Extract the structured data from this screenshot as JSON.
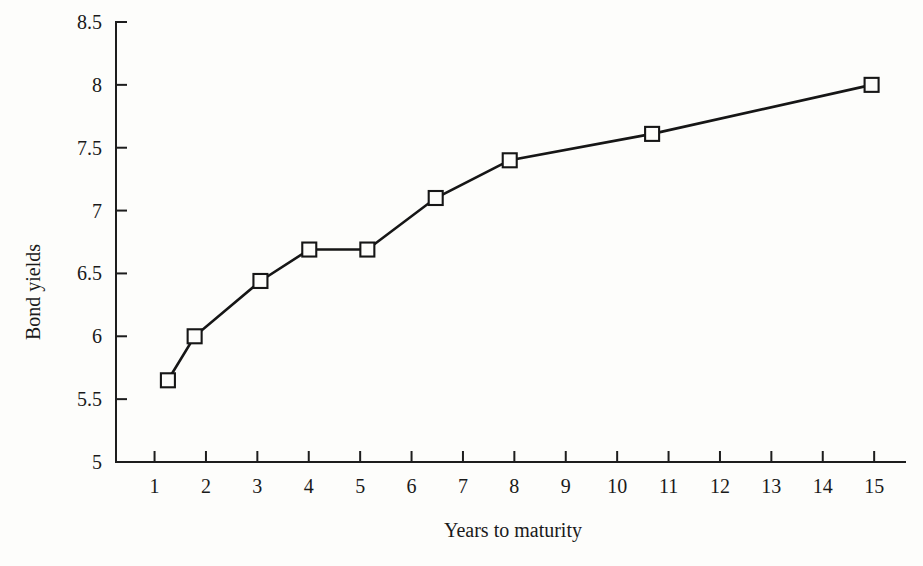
{
  "chart_data": {
    "type": "line",
    "title": "",
    "subtitle": "",
    "xlabel": "Years to maturity",
    "ylabel": "Bond yields",
    "xlim": [
      0.25,
      15.6
    ],
    "ylim": [
      5,
      8.5
    ],
    "grid": false,
    "legend": null,
    "marker": "open-square",
    "xticks": [
      1,
      2,
      3,
      4,
      5,
      6,
      7,
      8,
      9,
      10,
      11,
      12,
      13,
      14,
      15
    ],
    "xtick_labels": [
      "1",
      "2",
      "3",
      "4",
      "5",
      "6",
      "7",
      "8",
      "9",
      "10",
      "11",
      "12",
      "13",
      "14",
      "15"
    ],
    "yticks": [
      5,
      5.5,
      6,
      6.5,
      7,
      7.5,
      8,
      8.5
    ],
    "ytick_labels": [
      "5",
      "5.5",
      "6",
      "6.5",
      "7",
      "7.5",
      "8",
      "8.5"
    ],
    "series": [
      {
        "name": "Bond yields",
        "x": [
          1.26,
          1.78,
          3.06,
          4.01,
          5.14,
          6.47,
          7.91,
          10.68,
          14.95
        ],
        "y": [
          5.65,
          6.0,
          6.44,
          6.69,
          6.69,
          7.1,
          7.4,
          7.61,
          8.0
        ]
      }
    ]
  },
  "colors": {
    "line": "#161616",
    "axis": "#1d1d1d",
    "background": "#fdfdfb",
    "marker_fill": "#fdfdfb"
  }
}
